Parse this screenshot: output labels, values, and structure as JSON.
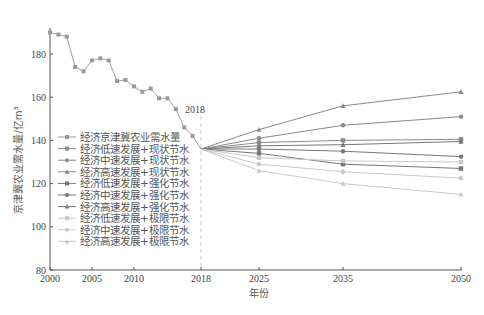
{
  "chart_data": {
    "type": "line",
    "title": "",
    "xlabel": "年份",
    "ylabel": "京津冀农业需水量/亿m³",
    "ylim": [
      80,
      195
    ],
    "xlim": [
      2000,
      2050
    ],
    "yticks": [
      80,
      100,
      120,
      140,
      160,
      180
    ],
    "xticks": [
      2000,
      2005,
      2010,
      2018,
      2025,
      2035,
      2050
    ],
    "annotation": {
      "text": "2018",
      "x": 2018,
      "style": "dashed vertical line"
    },
    "grid": false,
    "legend_position": "lower-left inside",
    "historical": {
      "name": "经济京津冀农业需水量",
      "x": [
        2000,
        2001,
        2002,
        2003,
        2004,
        2005,
        2006,
        2007,
        2008,
        2009,
        2010,
        2011,
        2012,
        2013,
        2014,
        2015,
        2016,
        2017,
        2018
      ],
      "values": [
        190,
        189,
        188,
        174,
        172,
        177,
        178,
        177,
        167.5,
        168,
        165,
        162.5,
        164,
        159.5,
        159.5,
        154.5,
        146,
        142,
        136
      ]
    },
    "projection_x": [
      2018,
      2025,
      2035,
      2050
    ],
    "series": [
      {
        "name": "经济低速发展+现状节水",
        "marker": "square",
        "color": "#8a8a8a",
        "values": [
          136,
          139,
          140,
          140.5
        ]
      },
      {
        "name": "经济中速发展+现状节水",
        "marker": "circle",
        "color": "#8a8a8a",
        "values": [
          136,
          141,
          147,
          151
        ]
      },
      {
        "name": "经济高速发展+现状节水",
        "marker": "triangle",
        "color": "#8a8a8a",
        "values": [
          136,
          145,
          156,
          162.5
        ]
      },
      {
        "name": "经济低速发展+强化节水",
        "marker": "square",
        "color": "#777777",
        "values": [
          136,
          134,
          129,
          127
        ]
      },
      {
        "name": "经济中速发展+强化节水",
        "marker": "circle",
        "color": "#777777",
        "values": [
          136,
          136,
          135,
          132.5
        ]
      },
      {
        "name": "经济高速发展+强化节水",
        "marker": "triangle",
        "color": "#777777",
        "values": [
          136,
          137.5,
          138,
          139.5
        ]
      },
      {
        "name": "经济低速发展+极限节水",
        "marker": "square",
        "color": "#c8c8c8",
        "values": [
          136,
          132,
          130.5,
          130
        ]
      },
      {
        "name": "经济中速发展+极限节水",
        "marker": "circle",
        "color": "#c8c8c8",
        "values": [
          136,
          129,
          125.5,
          122.5
        ]
      },
      {
        "name": "经济高速发展+极限节水",
        "marker": "triangle",
        "color": "#c8c8c8",
        "values": [
          136,
          126,
          120,
          115
        ]
      }
    ]
  },
  "legend": [
    {
      "label": "经济京津冀农业需水量",
      "color": "#9a9a9a",
      "marker": "square"
    },
    {
      "label": "经济低速发展+现状节水",
      "color": "#8a8a8a",
      "marker": "square"
    },
    {
      "label": "经济中速发展+现状节水",
      "color": "#8a8a8a",
      "marker": "circle"
    },
    {
      "label": "经济高速发展+现状节水",
      "color": "#8a8a8a",
      "marker": "triangle"
    },
    {
      "label": "经济低速发展+强化节水",
      "color": "#777777",
      "marker": "square"
    },
    {
      "label": "经济中速发展+强化节水",
      "color": "#777777",
      "marker": "circle"
    },
    {
      "label": "经济高速发展+强化节水",
      "color": "#777777",
      "marker": "triangle"
    },
    {
      "label": "经济低速发展+极限节水",
      "color": "#c8c8c8",
      "marker": "square"
    },
    {
      "label": "经济中速发展+极限节水",
      "color": "#c8c8c8",
      "marker": "circle"
    },
    {
      "label": "经济高速发展+极限节水",
      "color": "#c8c8c8",
      "marker": "triangle"
    }
  ],
  "labels": {
    "annotation_2018": "2018",
    "xlabel": "年份",
    "ylabel": "京津冀农业需水量/亿m³"
  }
}
